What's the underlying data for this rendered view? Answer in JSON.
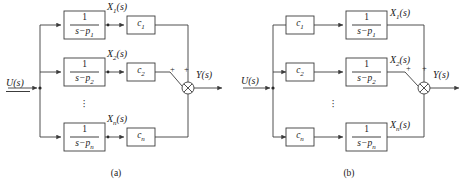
{
  "figure": {
    "panels": [
      {
        "id": "a",
        "caption": "(a)",
        "input_label": "U(s)",
        "output_label": "Y(s)",
        "order": "integrator-then-gain",
        "summing_junction": {
          "symbol": "circle-with-x",
          "signs": [
            "+",
            "+",
            "+"
          ]
        },
        "branches": [
          {
            "index": 1,
            "tf_numerator": "1",
            "tf_denominator": "s−p",
            "tf_denominator_sub": "1",
            "state_label": "X",
            "state_sub": "1",
            "state_suffix": "(s)",
            "gain_label": "c",
            "gain_sub": "1",
            "sign": "+"
          },
          {
            "index": 2,
            "tf_numerator": "1",
            "tf_denominator": "s−p",
            "tf_denominator_sub": "2",
            "state_label": "X",
            "state_sub": "2",
            "state_suffix": "(s)",
            "gain_label": "c",
            "gain_sub": "2",
            "sign": "+"
          },
          {
            "index": 3,
            "tf_numerator": "1",
            "tf_denominator": "s−p",
            "tf_denominator_sub": "n",
            "state_label": "X",
            "state_sub": "n",
            "state_suffix": "(s)",
            "gain_label": "c",
            "gain_sub": "n",
            "sign": "+"
          }
        ],
        "ellipsis": "⋮"
      },
      {
        "id": "b",
        "caption": "(b)",
        "input_label": "U(s)",
        "output_label": "Y(s)",
        "order": "gain-then-integrator",
        "summing_junction": {
          "symbol": "circle-with-x",
          "signs": [
            "+",
            "+",
            "+"
          ]
        },
        "branches": [
          {
            "index": 1,
            "tf_numerator": "1",
            "tf_denominator": "s−p",
            "tf_denominator_sub": "1",
            "state_label": "X",
            "state_sub": "1",
            "state_suffix": "(s)",
            "gain_label": "c",
            "gain_sub": "1",
            "sign": "+"
          },
          {
            "index": 2,
            "tf_numerator": "1",
            "tf_denominator": "s−p",
            "tf_denominator_sub": "2",
            "state_label": "X",
            "state_sub": "2",
            "state_suffix": "(s)",
            "gain_label": "c",
            "gain_sub": "2",
            "sign": "+"
          },
          {
            "index": 3,
            "tf_numerator": "1",
            "tf_denominator": "s−p",
            "tf_denominator_sub": "n",
            "state_label": "X",
            "state_sub": "n",
            "state_suffix": "(s)",
            "gain_label": "c",
            "gain_sub": "n",
            "sign": "+"
          }
        ],
        "ellipsis": "⋮"
      }
    ],
    "colors": {
      "line": "#3c3c3c",
      "text": "#1a1a1a",
      "background": "#ffffff"
    }
  }
}
